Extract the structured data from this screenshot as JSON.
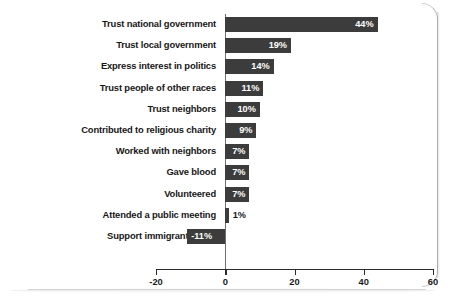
{
  "chart_data": {
    "type": "bar",
    "orientation": "horizontal",
    "title": "",
    "subtitle": "",
    "xlabel": "",
    "ylabel": "",
    "xlim": [
      -20,
      60
    ],
    "xticks": [
      -20,
      0,
      20,
      40,
      60
    ],
    "xtick_labels": [
      "-20",
      "0",
      "20",
      "40",
      "60"
    ],
    "grid": false,
    "legend": "none",
    "value_suffix": "%",
    "bar_color": "#3c3c3c",
    "axis_color": "#2b2b2b",
    "background_color": "#ffffff",
    "categories": [
      "Trust national government",
      "Trust local government",
      "Express interest in politics",
      "Trust people of other races",
      "Trust neighbors",
      "Contributed to religious charity",
      "Worked with neighbors",
      "Gave blood",
      "Volunteered",
      "Attended a public meeting",
      "Support immigrant rights"
    ],
    "values": [
      44,
      19,
      14,
      11,
      10,
      9,
      7,
      7,
      7,
      1,
      -11
    ],
    "value_labels": [
      "44%",
      "19%",
      "14%",
      "11%",
      "10%",
      "9%",
      "7%",
      "7%",
      "7%",
      "1%",
      "-11%"
    ],
    "label_placement": [
      "inside",
      "inside",
      "inside",
      "inside",
      "inside",
      "inside",
      "inside",
      "inside",
      "inside",
      "outside",
      "inside"
    ]
  }
}
